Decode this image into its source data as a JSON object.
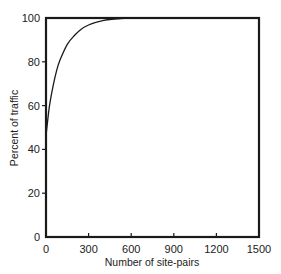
{
  "chart_data": {
    "type": "line",
    "title": "",
    "xlabel": "Number of site-pairs",
    "ylabel": "Percent of traffic",
    "xlim": [
      0,
      1500
    ],
    "ylim": [
      0,
      100
    ],
    "xticks": [
      0,
      300,
      600,
      900,
      1200,
      1500
    ],
    "yticks": [
      0,
      20,
      40,
      60,
      80,
      100
    ],
    "grid": false,
    "legend": null,
    "series": [
      {
        "name": "Cumulative percent of traffic",
        "x": [
          0,
          10,
          25,
          50,
          75,
          100,
          150,
          200,
          250,
          300,
          350,
          400,
          450,
          500,
          550,
          600,
          700,
          900,
          1200,
          1500
        ],
        "y": [
          46,
          52,
          60,
          69,
          76,
          81,
          88,
          92,
          95,
          96.8,
          98,
          98.8,
          99.3,
          99.6,
          99.8,
          100,
          100,
          100,
          100,
          100
        ]
      }
    ]
  }
}
